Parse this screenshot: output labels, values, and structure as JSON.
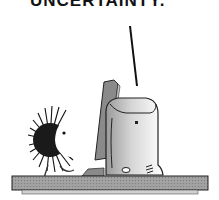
{
  "caption": {
    "text": "UNCERTAINTY."
  },
  "scene": {
    "description": "Cartoon of a spiky hedgehog-like creature facing a computer monitor and rounded computer tower on a desk",
    "colors": {
      "ink": "#111111",
      "desk": "#9a9a9a",
      "monitor": "#8a8a8a",
      "tower_shade": "#bdbdbd",
      "background": "#ffffff"
    }
  }
}
